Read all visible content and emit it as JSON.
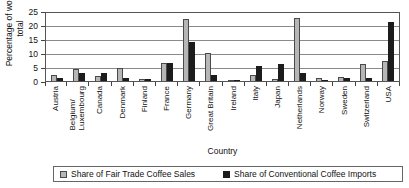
{
  "chart_data": {
    "type": "bar",
    "title": "",
    "xlabel": "Country",
    "ylabel": "Percentage of world total",
    "ylim": [
      0,
      25
    ],
    "yticks": [
      0,
      5,
      10,
      15,
      20,
      25
    ],
    "grid": true,
    "legend_position": "bottom",
    "categories": [
      "Austria",
      "Belgium/ Luxembourg",
      "Canada",
      "Denmark",
      "Finland",
      "France",
      "Germany",
      "Great Britain",
      "Ireland",
      "Italy",
      "Japan",
      "Netherlands",
      "Norway",
      "Sweden",
      "Switzerland",
      "USA"
    ],
    "series": [
      {
        "name": "Share of Fair Trade Coffee Sales",
        "color": "#b6b6b6",
        "values": [
          2.3,
          4.3,
          1.7,
          4.8,
          0.6,
          6.5,
          22.0,
          10.0,
          0.4,
          2.3,
          0.6,
          22.5,
          1.0,
          1.5,
          6.0,
          7.0
        ]
      },
      {
        "name": "Share of Conventional Coffee Imports",
        "color": "#1c1c1c",
        "values": [
          1.2,
          2.8,
          2.9,
          1.0,
          0.8,
          6.4,
          14.0,
          2.2,
          0.3,
          5.5,
          6.0,
          3.0,
          0.5,
          1.2,
          1.0,
          21.0
        ]
      }
    ]
  },
  "axis": {
    "y_title": "Percentage of world total",
    "x_title": "Country"
  }
}
